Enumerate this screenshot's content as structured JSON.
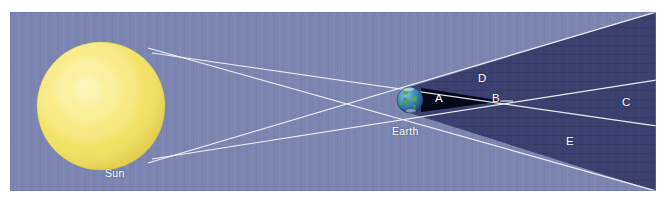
{
  "figure": {
    "background_color": "#ffffff",
    "panel_color": "#7c85b1"
  },
  "colors": {
    "page_background": "#ffffff",
    "sky_panel": "#7c85b1",
    "sky_panel_edge": "#6d77a6",
    "sun_body": "#f2e25e",
    "sun_highlight": "#faf3a8",
    "sun_shade": "#ddc84b",
    "penumbra": "#3a3f6e",
    "umbra": "#0d1028",
    "ray_line": "#f2f3f8",
    "earth_ocean": "#2f6fa8",
    "earth_land": "#4d9b53",
    "label_text": "#ffffff"
  },
  "labels": {
    "sun": "Sun",
    "earth": "Earth",
    "region_a": "A",
    "region_b": "B",
    "region_c": "C",
    "region_d": "D",
    "region_e": "E"
  },
  "bodies": {
    "sun": {
      "name": "Sun",
      "center_x": 101,
      "center_y": 106,
      "radius": 64
    },
    "earth": {
      "name": "Earth",
      "center_x": 410,
      "center_y": 100,
      "radius": 13
    }
  },
  "shadow_regions": {
    "umbra": {
      "label": "A",
      "tip_label": "B",
      "description": "dark central cone"
    },
    "penumbra": {
      "labels": [
        "C",
        "D",
        "E"
      ],
      "description": "lighter outer cone"
    }
  },
  "panel": {
    "x": 10,
    "y": 12,
    "width": 646,
    "height": 179
  }
}
